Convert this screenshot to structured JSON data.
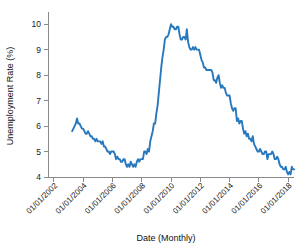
{
  "chart_data": {
    "type": "line",
    "title": "",
    "xlabel": "Date (Monthly)",
    "ylabel": "Unemployment Rate (%)",
    "xlim_years": [
      2001.6,
      2018.4
    ],
    "ylim": [
      4,
      10.4
    ],
    "grid": false,
    "legend": null,
    "line_color": "#2878be",
    "axis_color": "#8a8a8a",
    "y_ticks": [
      4,
      5,
      6,
      7,
      8,
      9,
      10
    ],
    "y_tick_labels": [
      "4",
      "5",
      "6",
      "7",
      "8",
      "9",
      "10"
    ],
    "x_ticks_years": [
      2002,
      2004,
      2006,
      2008,
      2010,
      2012,
      2014,
      2016,
      2018
    ],
    "x_tick_labels": [
      "01/01/2002",
      "01/01/2004",
      "01/01/2006",
      "01/01/2008",
      "01/01/2010",
      "01/01/2012",
      "01/01/2014",
      "01/01/2016",
      "01/01/2018"
    ],
    "series": [
      {
        "name": "Unemployment Rate",
        "x_start_year": 2003.25,
        "x_step_years": 0.08333333,
        "values": [
          5.8,
          5.9,
          6.0,
          6.1,
          6.3,
          6.1,
          6.1,
          6.0,
          5.9,
          5.9,
          5.8,
          5.7,
          5.7,
          5.8,
          5.7,
          5.6,
          5.6,
          5.5,
          5.5,
          5.4,
          5.5,
          5.4,
          5.4,
          5.4,
          5.3,
          5.4,
          5.2,
          5.2,
          5.1,
          5.0,
          5.0,
          4.9,
          5.0,
          5.0,
          5.0,
          4.9,
          4.7,
          4.8,
          4.7,
          4.7,
          4.6,
          4.6,
          4.7,
          4.7,
          4.5,
          4.4,
          4.5,
          4.4,
          4.6,
          4.5,
          4.4,
          4.5,
          4.4,
          4.6,
          4.7,
          4.6,
          4.7,
          4.7,
          4.7,
          5.0,
          5.0,
          4.9,
          5.1,
          5.0,
          5.4,
          5.6,
          5.8,
          6.1,
          6.1,
          6.5,
          6.8,
          7.3,
          7.8,
          8.3,
          8.7,
          9.0,
          9.4,
          9.5,
          9.5,
          9.6,
          9.8,
          10.0,
          9.9,
          9.9,
          9.8,
          9.8,
          9.9,
          9.9,
          9.6,
          9.4,
          9.4,
          9.5,
          9.5,
          9.4,
          9.8,
          9.3,
          9.1,
          9.0,
          9.0,
          9.1,
          9.0,
          9.1,
          9.0,
          9.0,
          9.0,
          8.8,
          8.6,
          8.5,
          8.3,
          8.3,
          8.2,
          8.2,
          8.2,
          8.2,
          8.2,
          8.1,
          7.8,
          7.8,
          7.7,
          7.9,
          8.0,
          7.7,
          7.5,
          7.6,
          7.5,
          7.5,
          7.3,
          7.2,
          7.2,
          7.2,
          6.9,
          6.7,
          6.6,
          6.7,
          6.7,
          6.2,
          6.3,
          6.1,
          6.2,
          6.2,
          5.9,
          5.7,
          5.8,
          5.6,
          5.7,
          5.5,
          5.5,
          5.4,
          5.6,
          5.3,
          5.2,
          5.1,
          5.0,
          5.0,
          5.1,
          5.0,
          4.9,
          4.9,
          5.0,
          5.0,
          4.7,
          4.9,
          4.9,
          4.9,
          5.0,
          4.9,
          4.7,
          4.7,
          4.8,
          4.7,
          4.5,
          4.4,
          4.4,
          4.3,
          4.3,
          4.4,
          4.2,
          4.1,
          4.2,
          4.1,
          4.4,
          4.3,
          4.3
        ]
      }
    ]
  },
  "axes": {
    "y_title": "Unemployment Rate (%)",
    "x_title": "Date (Monthly)"
  }
}
